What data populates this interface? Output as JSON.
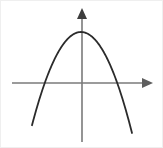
{
  "figure": {
    "title": "downward-opening parabola on coordinate axes",
    "width": 163,
    "height": 148,
    "background_color": "#ffffff",
    "border_color": "#efefef"
  },
  "chart_data": {
    "type": "line",
    "title": "",
    "subtitle": "",
    "xlabel": "",
    "ylabel": "",
    "legend": [],
    "legend_position": "none",
    "grid": false,
    "tick_labels": {
      "x": [],
      "y": []
    },
    "annotations": [],
    "curve_color": "#2b2b2b",
    "curve_width": 1.8,
    "axis_color": "#7a7a7a",
    "axis_width": 1.6,
    "series": [
      {
        "name": "parabola",
        "equation": "y = -a(x - h)^2 + k, a > 0",
        "opens": "down",
        "vertex": {
          "x": 81,
          "y": 32
        },
        "x_intercepts": [
          {
            "x": 49.5,
            "y": 83
          },
          {
            "x": 116,
            "y": 83
          }
        ],
        "y_intercept": {
          "x": 82,
          "y": 32.5
        },
        "endpoints": [
          {
            "x": 32,
            "y": 133
          },
          {
            "x": 132,
            "y": 133
          }
        ],
        "path": "M 32 133 Q 46.5 106.5 57.5 76.5 Q 70 42 81 32 Q 93 42 106 76.5 Q 117.5 107 132 133"
      }
    ],
    "axes": {
      "x_axis": {
        "name": "x-axis",
        "start": {
          "x": 12,
          "y": 83
        },
        "end": {
          "x": 152,
          "y": 83
        },
        "arrow": "right",
        "arrow_points": "142,78 153,83 142,88"
      },
      "y_axis": {
        "name": "y-axis",
        "start": {
          "x": 82,
          "y": 142
        },
        "end": {
          "x": 82,
          "y": 9
        },
        "arrow": "up",
        "arrow_points": "77,19 82,8 87,19"
      },
      "origin": {
        "x": 82,
        "y": 83
      }
    },
    "xlim": [
      12,
      153
    ],
    "ylim": [
      8,
      142
    ]
  }
}
